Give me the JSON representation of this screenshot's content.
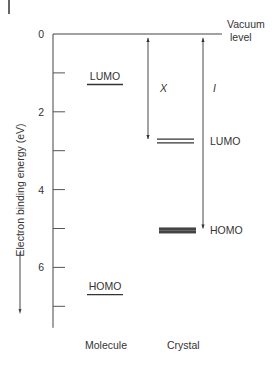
{
  "chart_data": {
    "type": "energy-level-diagram",
    "title": "",
    "ylabel": "Electron binding energy (eV)",
    "ylim": [
      0,
      7.5
    ],
    "y_ticks": [
      {
        "value": 0,
        "label": "0"
      },
      {
        "value": 1,
        "label": ""
      },
      {
        "value": 2,
        "label": "2"
      },
      {
        "value": 3,
        "label": ""
      },
      {
        "value": 4,
        "label": "4"
      },
      {
        "value": 5,
        "label": ""
      },
      {
        "value": 6,
        "label": "6"
      },
      {
        "value": 7,
        "label": ""
      }
    ],
    "vacuum_level": {
      "value": 0,
      "label_line1": "Vacuum",
      "label_line2": "level"
    },
    "columns": [
      {
        "name": "Molecule",
        "levels": [
          {
            "label": "LUMO",
            "energy": 1.3,
            "style": "single"
          },
          {
            "label": "HOMO",
            "energy": 6.7,
            "style": "single"
          }
        ]
      },
      {
        "name": "Crystal",
        "levels": [
          {
            "label": "LUMO",
            "energy": 2.75,
            "style": "double"
          },
          {
            "label": "HOMO",
            "energy": 5.05,
            "style": "band"
          }
        ]
      }
    ],
    "arrows": [
      {
        "label": "X",
        "from": 0.1,
        "to": 2.7,
        "description": "electron affinity"
      },
      {
        "label": "I",
        "from": 0.1,
        "to": 5.0,
        "description": "ionization energy"
      }
    ]
  },
  "corner_mark": "|"
}
